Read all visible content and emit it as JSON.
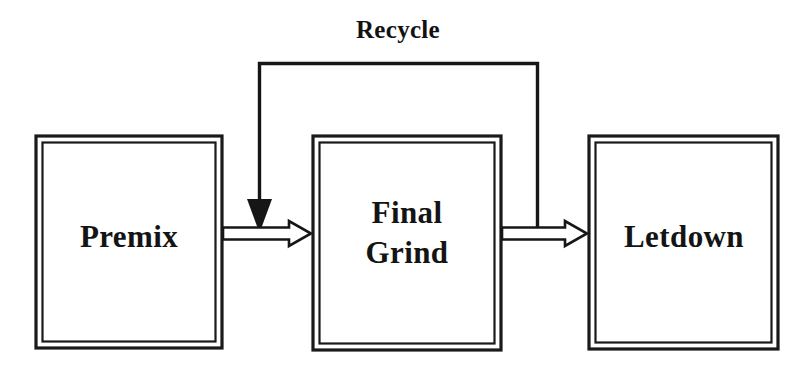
{
  "diagram": {
    "type": "process-flow-block-diagram",
    "title": "",
    "background_color": "#ffffff",
    "line_color": "#161616",
    "text_color": "#141414",
    "nodes": [
      {
        "id": "premix",
        "label": "Premix",
        "label_lines": [
          "Premix"
        ],
        "shape": "double-bordered-rectangle",
        "x": 36,
        "y": 136,
        "width": 186,
        "height": 212
      },
      {
        "id": "final-grind",
        "label": "Final Grind",
        "label_lines": [
          "Final",
          "Grind"
        ],
        "shape": "double-bordered-rectangle",
        "x": 313,
        "y": 136,
        "width": 188,
        "height": 214
      },
      {
        "id": "letdown",
        "label": "Letdown",
        "label_lines": [
          "Letdown"
        ],
        "shape": "double-bordered-rectangle",
        "x": 589,
        "y": 136,
        "width": 189,
        "height": 213
      }
    ],
    "edges": [
      {
        "id": "premix-to-final-grind",
        "from": "premix",
        "to": "final-grind",
        "label": "",
        "style": "hollow-block-arrow",
        "direction": "right"
      },
      {
        "id": "final-grind-to-letdown",
        "from": "final-grind",
        "to": "letdown",
        "label": "",
        "style": "hollow-block-arrow",
        "direction": "right"
      },
      {
        "id": "recycle-loop",
        "from": "final-grind-to-letdown",
        "to": "premix-to-final-grind",
        "label": "Recycle",
        "style": "solid-line-with-filled-arrowhead",
        "direction": "up-left-down",
        "label_x": 398,
        "label_y": 38
      }
    ]
  }
}
